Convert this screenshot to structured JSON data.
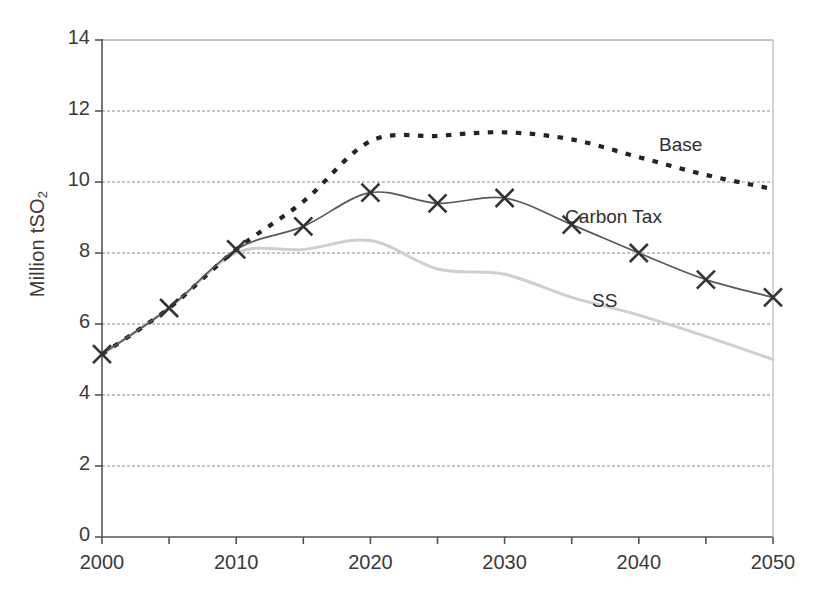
{
  "chart_data": {
    "type": "line",
    "title": "",
    "xlabel": "",
    "ylabel": "Million tSO2",
    "ylabel_html": "Million tSO",
    "ylabel_sub": "2",
    "xlim": [
      2000,
      2050
    ],
    "ylim": [
      0,
      14
    ],
    "grid": true,
    "gridlines_y": [
      2,
      4,
      6,
      8,
      10,
      12,
      14
    ],
    "legend_position": "inline-annotations",
    "x_tick_labels": [
      "2000",
      "2010",
      "2020",
      "2030",
      "2040",
      "2050"
    ],
    "x_tick_values": [
      2000,
      2010,
      2020,
      2030,
      2040,
      2050
    ],
    "x_minor_ticks": [
      2005,
      2015,
      2025,
      2035,
      2045
    ],
    "y_tick_labels": [
      "0",
      "2",
      "4",
      "6",
      "8",
      "10",
      "12",
      "14"
    ],
    "y_tick_values": [
      0,
      2,
      4,
      6,
      8,
      10,
      12,
      14
    ],
    "x": [
      2000,
      2005,
      2010,
      2015,
      2020,
      2025,
      2030,
      2035,
      2040,
      2045,
      2050
    ],
    "series": [
      {
        "name": "Base",
        "style": "dotted",
        "color": "#242424",
        "marker": "none",
        "values": [
          5.15,
          6.45,
          8.1,
          9.45,
          11.15,
          11.3,
          11.4,
          11.2,
          10.7,
          10.2,
          9.8
        ]
      },
      {
        "name": "Carbon Tax",
        "style": "solid",
        "color": "#595959",
        "marker": "x",
        "values": [
          5.15,
          6.45,
          8.1,
          8.75,
          9.7,
          9.4,
          9.55,
          8.8,
          8.0,
          7.25,
          6.75
        ]
      },
      {
        "name": "SS",
        "style": "solid",
        "color": "#cfcfcf",
        "marker": "none",
        "values": [
          5.15,
          6.45,
          8.0,
          8.1,
          8.35,
          7.55,
          7.4,
          6.75,
          6.25,
          5.65,
          5.0
        ]
      }
    ],
    "annotations": [
      {
        "text": "Base",
        "x": 2043,
        "y": 11.0
      },
      {
        "text": "Carbon Tax",
        "x": 2036,
        "y": 8.95
      },
      {
        "text": "SS",
        "x": 2038,
        "y": 6.6
      }
    ]
  },
  "labels": {
    "base": "Base",
    "carbon_tax": "Carbon Tax",
    "ss": "SS"
  }
}
